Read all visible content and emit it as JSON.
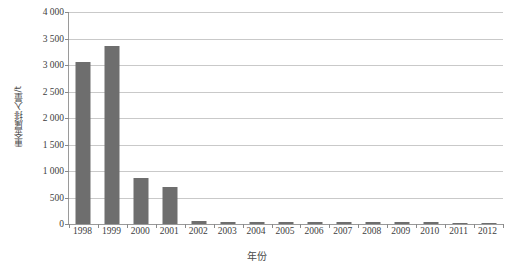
{
  "chart_data": {
    "type": "bar",
    "title": "",
    "subtitle": "",
    "xlabel": "年份",
    "ylabel": "重金属排入量/t",
    "categories": [
      "1998",
      "1999",
      "2000",
      "2001",
      "2002",
      "2003",
      "2004",
      "2005",
      "2006",
      "2007",
      "2008",
      "2009",
      "2010",
      "2011",
      "2012"
    ],
    "values": [
      3050,
      3350,
      870,
      690,
      55,
      45,
      30,
      35,
      30,
      30,
      30,
      30,
      30,
      25,
      25
    ],
    "series": [
      {
        "name": "重金属排入量",
        "values": [
          3050,
          3350,
          870,
          690,
          55,
          45,
          30,
          35,
          30,
          30,
          30,
          30,
          30,
          25,
          25
        ]
      }
    ],
    "ylim": [
      0,
      4000
    ],
    "ytick_values": [
      0,
      500,
      1000,
      1500,
      2000,
      2500,
      3000,
      3500,
      4000
    ],
    "ytick_labels": [
      "0",
      "500",
      "1 000",
      "1 500",
      "2 000",
      "2 500",
      "3 000",
      "3 500",
      "4 000"
    ],
    "grid": true,
    "grid_axis": "y",
    "legend": false,
    "legend_position": "none",
    "bar_color": "#6e6e6e",
    "gridline_color": "#c9c9c9",
    "axis_color": "#9a9a9a",
    "background_color": "#ffffff",
    "text_color": "#3d3d3d"
  }
}
